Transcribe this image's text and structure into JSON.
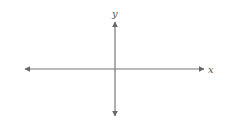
{
  "diagram": {
    "type": "cartesian-axes",
    "x_axis": {
      "label": "x",
      "bidirectional": true
    },
    "y_axis": {
      "label": "y",
      "bidirectional": true
    },
    "colors": {
      "axis": "#777777",
      "label": "#555555",
      "background": "#ffffff"
    }
  }
}
